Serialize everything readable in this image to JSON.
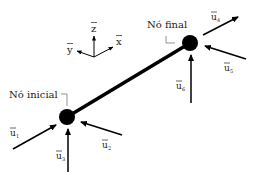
{
  "diagram": {
    "title": "",
    "colors": {
      "line": "#000000",
      "text": "#222222",
      "leader": "#777777"
    },
    "axes": {
      "z": {
        "label": "z̅",
        "base": "z",
        "overbar": true
      },
      "y": {
        "label": "y̅",
        "base": "y",
        "overbar": true
      },
      "x": {
        "label": "x̅",
        "base": "x",
        "overbar": true
      }
    },
    "nodes": [
      {
        "id": "start",
        "label": "Nó inicial",
        "cx": 67,
        "cy": 117
      },
      {
        "id": "end",
        "label": "Nó final",
        "cx": 190,
        "cy": 43
      }
    ],
    "element": {
      "from": "start",
      "to": "end"
    },
    "displacements": [
      {
        "id": "u1",
        "base": "u",
        "sub": "1",
        "node": "start",
        "direction": "along x (toward node)"
      },
      {
        "id": "u2",
        "base": "u",
        "sub": "2",
        "node": "start",
        "direction": "along y (toward node)"
      },
      {
        "id": "u3",
        "base": "u",
        "sub": "3",
        "node": "start",
        "direction": "along z (upward)"
      },
      {
        "id": "u4",
        "base": "u",
        "sub": "4",
        "node": "end",
        "direction": "along x (away from node)"
      },
      {
        "id": "u5",
        "base": "u",
        "sub": "5",
        "node": "end",
        "direction": "along y (toward node)"
      },
      {
        "id": "u6",
        "base": "u",
        "sub": "6",
        "node": "end",
        "direction": "along z (upward)"
      }
    ]
  }
}
